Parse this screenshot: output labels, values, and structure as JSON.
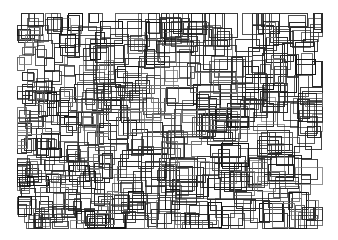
{
  "artwork": {
    "title": "Overlapping Rectangles Generative Drawing",
    "medium": "line drawing",
    "canvas": {
      "width": 338,
      "height": 240,
      "background_color": "#ffffff"
    },
    "field": {
      "x_min": 17,
      "y_min": 13,
      "x_max": 322,
      "y_max": 228,
      "description": "Dense field of unfilled axis-aligned rectangles with thin dark strokes, denser and smaller toward the left and bottom-left, larger and sparser toward the right-center."
    },
    "stroke": {
      "color": "#2b2b2b",
      "color_light": "#6f6f6f",
      "color_dark": "#111111",
      "width_min": 0.6,
      "width_max": 1.1
    },
    "generator": {
      "seed": 20240517,
      "rect_count": 620,
      "min_size": 4,
      "max_size": 34,
      "fill": "none"
    }
  }
}
